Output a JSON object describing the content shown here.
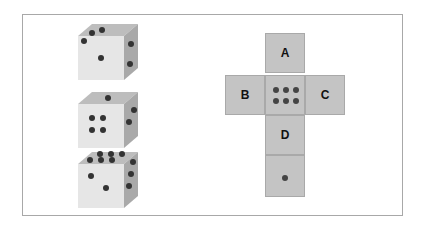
{
  "dice": [
    {
      "top": 3,
      "front": 1,
      "right": 2
    },
    {
      "top": 1,
      "front": 4,
      "right": 2
    },
    {
      "top": 6,
      "front": 2,
      "right": 3
    }
  ],
  "net": {
    "labels": {
      "A": "A",
      "B": "B",
      "C": "C",
      "D": "D"
    },
    "center_pips": 6,
    "bottom_pips": 1
  },
  "colors": {
    "face": "#c4c4c4",
    "pip": "#444444",
    "border": "#a8a8a8"
  }
}
